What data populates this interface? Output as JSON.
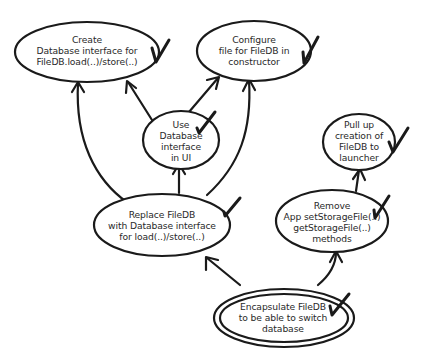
{
  "diagram": {
    "type": "mikado-graph",
    "nodes": [
      {
        "id": "create-db-interface",
        "label": "Create\nDatabase interface for\nFileDB.load(..)/store(..)",
        "done": true
      },
      {
        "id": "configure-file",
        "label": "Configure\nfile for FileDB in\nconstructor",
        "done": true
      },
      {
        "id": "use-db-interface",
        "label": "Use\nDatabase\ninterface\nin UI",
        "done": true
      },
      {
        "id": "pull-up-creation",
        "label": "Pull up\ncreation of\nFileDB to\nlauncher",
        "done": true
      },
      {
        "id": "replace-filedb",
        "label": "Replace FileDB\nwith Database interface\nfor load(..)/store(..)",
        "done": true
      },
      {
        "id": "remove-app-methods",
        "label": "Remove\nApp setStorageFile(..)\ngetStorageFile(..)\nmethods",
        "done": true
      },
      {
        "id": "encapsulate-filedb",
        "label": "Encapsulate FileDB\nto be able to switch\ndatabase",
        "done": true,
        "goal": true
      }
    ],
    "edges": [
      {
        "from": "encapsulate-filedb",
        "to": "replace-filedb"
      },
      {
        "from": "encapsulate-filedb",
        "to": "remove-app-methods"
      },
      {
        "from": "remove-app-methods",
        "to": "pull-up-creation"
      },
      {
        "from": "replace-filedb",
        "to": "use-db-interface"
      },
      {
        "from": "replace-filedb",
        "to": "create-db-interface"
      },
      {
        "from": "replace-filedb",
        "to": "configure-file"
      },
      {
        "from": "use-db-interface",
        "to": "create-db-interface"
      },
      {
        "from": "use-db-interface",
        "to": "configure-file"
      }
    ],
    "colors": {
      "stroke": "#1a1a1a",
      "text": "#2a2a2a",
      "background": "#ffffff"
    }
  }
}
